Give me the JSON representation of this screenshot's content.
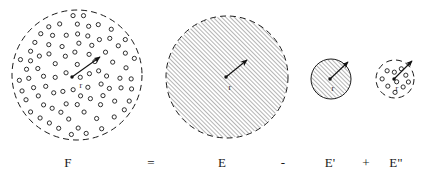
{
  "figure": {
    "kind": "set-decomposition-diagram",
    "background_color": "#ffffff",
    "ink_color": "#1a1a1a",
    "width": 421,
    "height": 180,
    "equation_text": "F = E - E' + E\"",
    "equation_terms": [
      {
        "id": "term-F",
        "label": "F",
        "x": 68,
        "y": 163
      },
      {
        "id": "op-equals",
        "label": "=",
        "x": 151,
        "y": 163
      },
      {
        "id": "term-E",
        "label": "E",
        "x": 222,
        "y": 163
      },
      {
        "id": "op-minus",
        "label": "-",
        "x": 283,
        "y": 163
      },
      {
        "id": "term-EPrime",
        "label": "E'",
        "x": 330,
        "y": 163
      },
      {
        "id": "op-plus",
        "label": "+",
        "x": 366,
        "y": 163
      },
      {
        "id": "term-EDoublePrime",
        "label": "E\"",
        "x": 396,
        "y": 163
      }
    ],
    "regions": [
      {
        "id": "region-F",
        "label": "F",
        "cx": 77,
        "cy": 75,
        "r": 65,
        "border": "dashed",
        "fill": "dots",
        "radius_label": "r",
        "radius_label_x": 81,
        "radius_label_y": 85,
        "arrow_from_x": 72,
        "arrow_from_y": 77,
        "arrow_to_x": 100,
        "arrow_to_y": 57
      },
      {
        "id": "region-E",
        "label": "E",
        "cx": 227,
        "cy": 77,
        "r": 61,
        "border": "dashed",
        "fill": "hatch",
        "radius_label": "r",
        "radius_label_x": 230,
        "radius_label_y": 87,
        "arrow_from_x": 226,
        "arrow_from_y": 77,
        "arrow_to_x": 247,
        "arrow_to_y": 60
      },
      {
        "id": "region-E-prime",
        "label": "E'",
        "cx": 331,
        "cy": 79,
        "r": 20,
        "border": "solid",
        "fill": "hatch",
        "radius_label": "r",
        "radius_label_x": 333,
        "radius_label_y": 88,
        "arrow_from_x": 330,
        "arrow_from_y": 79,
        "arrow_to_x": 348,
        "arrow_to_y": 62
      },
      {
        "id": "region-E-double-prime",
        "label": "E\"",
        "cx": 395,
        "cy": 79,
        "r": 19,
        "border": "dashed",
        "fill": "dots",
        "radius_label": "r",
        "radius_label_x": 397,
        "radius_label_y": 88,
        "arrow_from_x": 394,
        "arrow_from_y": 79,
        "arrow_to_x": 412,
        "arrow_to_y": 61
      }
    ],
    "dot_marker": {
      "shape": "small-open-circle",
      "radius": 2.1
    },
    "hatch": {
      "angle_deg": 45,
      "spacing": 3
    },
    "dash": {
      "pattern": "6 4"
    }
  }
}
